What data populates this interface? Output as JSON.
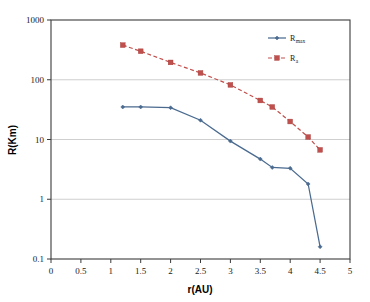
{
  "chart_data": {
    "type": "line",
    "title": "",
    "xlabel": "r(AU)",
    "ylabel": "R(Km)",
    "xlim": [
      0,
      5
    ],
    "ylim": [
      0.1,
      1000
    ],
    "yscale": "log",
    "xscale": "linear",
    "grid": "horizontal",
    "legend_position": "top-right",
    "xticks": [
      "0",
      "0.5",
      "1",
      "1.5",
      "2",
      "2.5",
      "3",
      "3.5",
      "4",
      "4.5",
      "5"
    ],
    "xtick_values": [
      0,
      0.5,
      1,
      1.5,
      2,
      2.5,
      3,
      3.5,
      4,
      4.5,
      5
    ],
    "yticks": [
      "0.1",
      "1",
      "10",
      "100",
      "1000"
    ],
    "ytick_values": [
      0.1,
      1,
      10,
      100,
      1000
    ],
    "series": [
      {
        "name": "R",
        "subscript": "max",
        "color": "#4a6a8f",
        "marker": "diamond",
        "linestyle": "solid",
        "x": [
          1.2,
          1.5,
          2.0,
          2.5,
          3.0,
          3.5,
          3.7,
          4.0,
          4.3,
          4.5
        ],
        "values": [
          35,
          35,
          34,
          21,
          9.4,
          4.7,
          3.4,
          3.3,
          1.8,
          0.16
        ]
      },
      {
        "name": "R",
        "subscript": "a",
        "color": "#c0504d",
        "marker": "square",
        "linestyle": "dashed",
        "x": [
          1.2,
          1.5,
          2.0,
          2.5,
          3.0,
          3.5,
          3.7,
          4.0,
          4.3,
          4.5
        ],
        "values": [
          380,
          300,
          195,
          130,
          82,
          45,
          35,
          20,
          11,
          6.7
        ]
      }
    ]
  },
  "legend": {
    "entries": [
      {
        "label": "R",
        "subscript": "max"
      },
      {
        "label": "R",
        "subscript": "a"
      }
    ]
  },
  "axes": {
    "x_title": "r(AU)",
    "y_title": "R(Km)"
  }
}
